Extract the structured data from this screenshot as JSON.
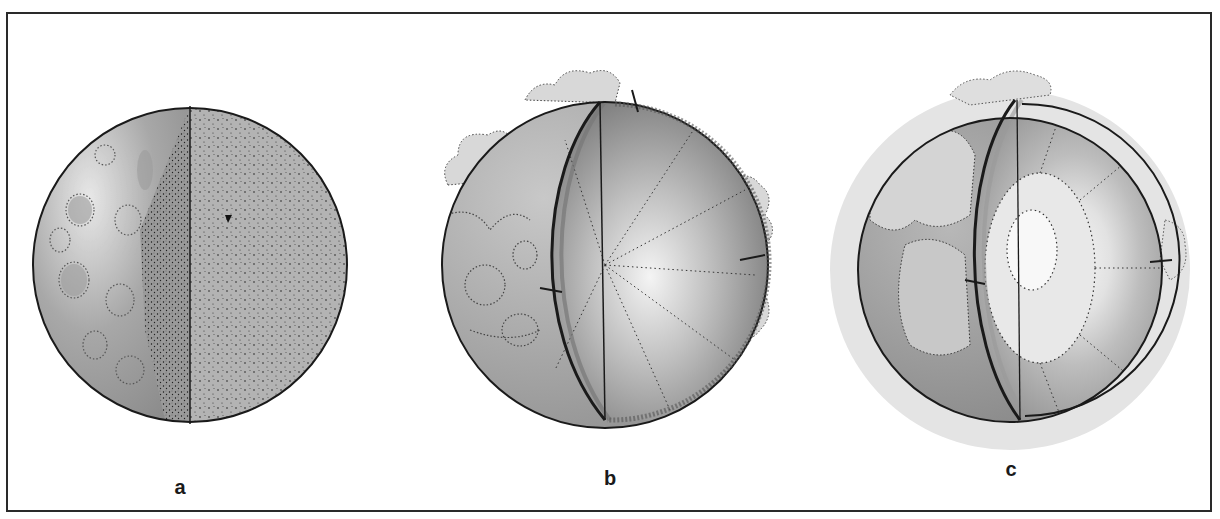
{
  "figure": {
    "panels": [
      {
        "id": "a",
        "label": "a",
        "description": "Sphere with a wedge cut away, speckled granular surface and cratered left exterior"
      },
      {
        "id": "b",
        "label": "b",
        "description": "Sphere cut open showing radial inner structure with a thin outer shell and cloud-like outgrowths"
      },
      {
        "id": "c",
        "label": "c",
        "description": "Sphere cut open showing concentric inner layers and a pale central core, surrounded by a light halo"
      }
    ]
  },
  "colors": {
    "border": "#2a2a2a",
    "outline": "#1a1a1a",
    "fill_dark": "#8a8a8a",
    "fill_mid": "#a8a8a8",
    "fill_light": "#c8c8c8",
    "fill_pale": "#e6e6e6",
    "halo": "#e4e4e4"
  }
}
